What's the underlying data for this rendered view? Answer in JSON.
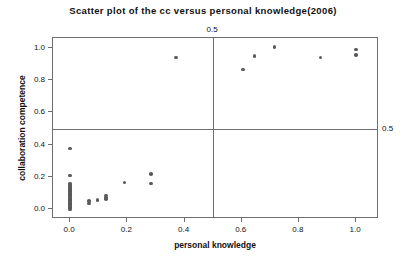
{
  "chart_data": {
    "type": "scatter",
    "title": "Scatter plot of the cc versus personal knowledge(2006)",
    "xlabel": "personal knowledge",
    "ylabel": "collaboration competence",
    "xlim": [
      -0.06,
      1.08
    ],
    "ylim": [
      -0.06,
      1.06
    ],
    "xticks": [
      0.0,
      0.2,
      0.4,
      0.6,
      0.8,
      1.0
    ],
    "xticklabels": [
      "0.0",
      "0.2",
      "0.4",
      "0.6",
      "0.8",
      "1.0"
    ],
    "yticks": [
      0.0,
      0.2,
      0.4,
      0.6,
      0.8,
      1.0
    ],
    "yticklabels": [
      "0.0",
      "0.2",
      "0.4",
      "0.6",
      "0.8",
      "1.0"
    ],
    "grid": false,
    "legend": null,
    "marker_color": "#5a5a5a",
    "frame_color": "#6e6e6e",
    "reference_lines": [
      {
        "name": "vertical-threshold",
        "orientation": "vertical",
        "value": 0.5,
        "label": "0.5",
        "label_position": "top"
      },
      {
        "name": "horizontal-threshold",
        "orientation": "horizontal",
        "value": 0.5,
        "label": "0.5",
        "label_position": "right"
      }
    ],
    "points": [
      {
        "x": 0.0,
        "y": 0.375
      },
      {
        "x": 0.0,
        "y": 0.21
      },
      {
        "x": 0.0,
        "y": 0.16
      },
      {
        "x": 0.0,
        "y": 0.15
      },
      {
        "x": 0.0,
        "y": 0.14
      },
      {
        "x": 0.0,
        "y": 0.13
      },
      {
        "x": 0.0,
        "y": 0.12
      },
      {
        "x": 0.0,
        "y": 0.112
      },
      {
        "x": 0.0,
        "y": 0.104
      },
      {
        "x": 0.0,
        "y": 0.096
      },
      {
        "x": 0.0,
        "y": 0.088
      },
      {
        "x": 0.0,
        "y": 0.08
      },
      {
        "x": 0.0,
        "y": 0.072
      },
      {
        "x": 0.0,
        "y": 0.064
      },
      {
        "x": 0.0,
        "y": 0.056
      },
      {
        "x": 0.0,
        "y": 0.048
      },
      {
        "x": 0.0,
        "y": 0.04
      },
      {
        "x": 0.0,
        "y": 0.032
      },
      {
        "x": 0.0,
        "y": 0.024
      },
      {
        "x": 0.0,
        "y": 0.016
      },
      {
        "x": 0.0,
        "y": 0.008
      },
      {
        "x": 0.0,
        "y": 0.0
      },
      {
        "x": 0.065,
        "y": 0.05
      },
      {
        "x": 0.065,
        "y": 0.035
      },
      {
        "x": 0.095,
        "y": 0.058
      },
      {
        "x": 0.125,
        "y": 0.085
      },
      {
        "x": 0.125,
        "y": 0.072
      },
      {
        "x": 0.125,
        "y": 0.062
      },
      {
        "x": 0.19,
        "y": 0.165
      },
      {
        "x": 0.282,
        "y": 0.22
      },
      {
        "x": 0.282,
        "y": 0.16
      },
      {
        "x": 0.37,
        "y": 0.94
      },
      {
        "x": 0.605,
        "y": 0.865
      },
      {
        "x": 0.645,
        "y": 0.95
      },
      {
        "x": 0.715,
        "y": 1.005
      },
      {
        "x": 0.875,
        "y": 0.94
      },
      {
        "x": 1.0,
        "y": 0.99
      },
      {
        "x": 1.0,
        "y": 0.955
      }
    ]
  }
}
